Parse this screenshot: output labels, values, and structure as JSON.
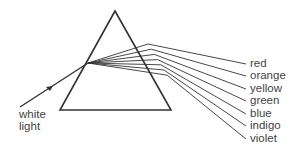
{
  "diagram": {
    "input_label_line1": "white",
    "input_label_line2": "light",
    "spectrum": [
      {
        "label": "red",
        "y": 64
      },
      {
        "label": "orange",
        "y": 76
      },
      {
        "label": "yellow",
        "y": 89
      },
      {
        "label": "green",
        "y": 101
      },
      {
        "label": "blue",
        "y": 114
      },
      {
        "label": "indigo",
        "y": 126
      },
      {
        "label": "violet",
        "y": 139
      }
    ],
    "colors": {
      "line": "#333333",
      "text": "#444444"
    }
  }
}
